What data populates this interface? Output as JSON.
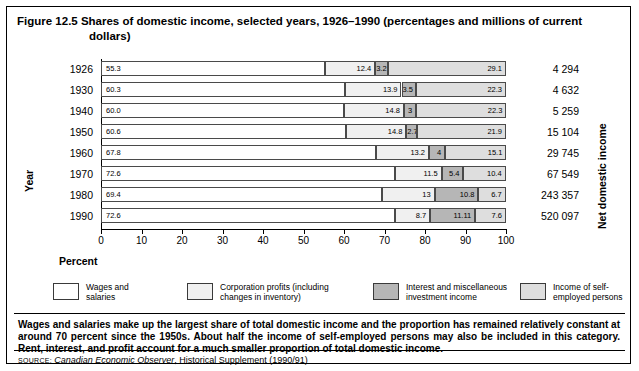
{
  "figure": {
    "title_line1": "Figure 12.5 Shares of domestic income, selected years, 1926–1990 (percentages and millions of current",
    "title_line2": "dollars)",
    "y_axis_title": "Year",
    "x_axis_title": "Percent",
    "right_axis_title": "Net domestic income",
    "note": "Wages and salaries make up the largest share of total domestic income and the proportion has remained relatively constant at around 70 percent since the 1950s. About half the income of self-employed persons may also be included in this category. Rent, interest, and profit account for a much smaller proportion of total domestic income.",
    "source_label": "SOURCE:",
    "source_italic": "Canadian Economic Observer",
    "source_rest": ", Historical Supplement (1990/91)"
  },
  "legend": {
    "items": [
      {
        "label": "Wages and\nsalaries",
        "color": "#ffffff",
        "left": 0,
        "textwidth": 88
      },
      {
        "label": "Corporation profits (including\nchanges in inventory)",
        "color": "#f0f0f0",
        "left": 134,
        "textwidth": 150
      },
      {
        "label": "Interest and miscellaneous\ninvestment income",
        "color": "#b6b6b6",
        "left": 320,
        "textwidth": 140
      },
      {
        "label": "Income of self-\nemployed persons",
        "color": "#dedede",
        "left": 467,
        "textwidth": 100
      }
    ]
  },
  "chart_data": {
    "type": "bar",
    "title": "Figure 12.5 Shares of domestic income, selected years, 1926–1990 (percentages and millions of current dollars)",
    "orientation": "horizontal",
    "stacked": true,
    "stacked_mode": "percent",
    "xlabel": "Percent",
    "ylabel": "Year",
    "xlim": [
      0,
      100
    ],
    "xticks": [
      0,
      10,
      20,
      30,
      40,
      50,
      60,
      70,
      80,
      90,
      100
    ],
    "grid": false,
    "legend_position": "bottom",
    "categories": [
      "1926",
      "1930",
      "1940",
      "1950",
      "1960",
      "1970",
      "1980",
      "1990"
    ],
    "series": [
      {
        "name": "Wages and salaries",
        "color": "#ffffff",
        "values": [
          55.3,
          60.3,
          60.0,
          60.6,
          67.8,
          72.6,
          69.4,
          72.6
        ]
      },
      {
        "name": "Corporation profits (including changes in inventory)",
        "color": "#f0f0f0",
        "values": [
          12.4,
          13.9,
          14.8,
          14.8,
          13.2,
          11.5,
          13.0,
          8.7
        ]
      },
      {
        "name": "Interest and miscellaneous investment income",
        "color": "#b6b6b6",
        "values": [
          3.2,
          3.5,
          3.0,
          2.7,
          4.0,
          5.4,
          10.8,
          11.11
        ]
      },
      {
        "name": "Income of self-employed persons",
        "color": "#dedede",
        "values": [
          29.1,
          22.3,
          22.3,
          21.9,
          15.1,
          10.4,
          6.7,
          7.6
        ]
      }
    ],
    "secondary_axis": {
      "name": "Net domestic income",
      "values": [
        "4 294",
        "4 632",
        "5 259",
        "15 104",
        "29 745",
        "67 549",
        "243 357",
        "520 097"
      ]
    }
  }
}
